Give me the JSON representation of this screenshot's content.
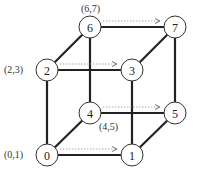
{
  "diagram": {
    "type": "hypercube-3d",
    "nodes": [
      {
        "id": "0",
        "label": "0",
        "x": 47,
        "y": 155
      },
      {
        "id": "1",
        "label": "1",
        "x": 132,
        "y": 155
      },
      {
        "id": "2",
        "label": "2",
        "x": 47,
        "y": 70
      },
      {
        "id": "3",
        "label": "3",
        "x": 132,
        "y": 70
      },
      {
        "id": "4",
        "label": "4",
        "x": 90,
        "y": 113
      },
      {
        "id": "5",
        "label": "5",
        "x": 175,
        "y": 113
      },
      {
        "id": "6",
        "label": "6",
        "x": 90,
        "y": 27
      },
      {
        "id": "7",
        "label": "7",
        "x": 175,
        "y": 27
      }
    ],
    "edges": [
      [
        "0",
        "1"
      ],
      [
        "2",
        "3"
      ],
      [
        "4",
        "5"
      ],
      [
        "6",
        "7"
      ],
      [
        "0",
        "2"
      ],
      [
        "1",
        "3"
      ],
      [
        "4",
        "6"
      ],
      [
        "5",
        "7"
      ],
      [
        "0",
        "4"
      ],
      [
        "1",
        "5"
      ],
      [
        "2",
        "6"
      ],
      [
        "3",
        "7"
      ]
    ],
    "dotted_arrows": [
      {
        "from": "0",
        "to": "1"
      },
      {
        "from": "2",
        "to": "3"
      },
      {
        "from": "4",
        "to": "5"
      },
      {
        "from": "6",
        "to": "7"
      }
    ],
    "pair_labels": [
      {
        "text": "(0,1)",
        "x": 4,
        "y": 149
      },
      {
        "text": "(2,3)",
        "x": 4,
        "y": 64
      },
      {
        "text": "(4,5)",
        "x": 99,
        "y": 121
      },
      {
        "text": "(6,7)",
        "x": 81,
        "y": 3
      }
    ]
  }
}
